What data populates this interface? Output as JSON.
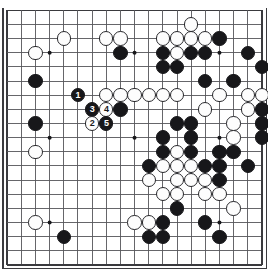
{
  "diagram": {
    "board_size": 19,
    "geometry": {
      "origin_x": 7.2,
      "origin_y": 10.3,
      "step": 14.15,
      "stone_radius": 7.2,
      "hoshi_radius": 2.0
    },
    "colors": {
      "background": "#ffffff",
      "line": "#55555a",
      "border": "#3a3a3e",
      "black_stone": "#17171a",
      "white_stone": "#fdfdfd",
      "white_stone_edge": "#28282c",
      "black_label": "#ffffff",
      "white_label": "#1a1a1d"
    },
    "hoshi": [
      {
        "col": 3,
        "row": 3
      },
      {
        "col": 9,
        "row": 3
      },
      {
        "col": 15,
        "row": 3
      },
      {
        "col": 3,
        "row": 9
      },
      {
        "col": 9,
        "row": 9
      },
      {
        "col": 15,
        "row": 9
      },
      {
        "col": 3,
        "row": 15
      },
      {
        "col": 9,
        "row": 15
      },
      {
        "col": 15,
        "row": 15
      }
    ],
    "stones": [
      {
        "col": 13,
        "row": 1,
        "color": "white"
      },
      {
        "col": 4,
        "row": 2,
        "color": "white"
      },
      {
        "col": 7,
        "row": 2,
        "color": "white"
      },
      {
        "col": 8,
        "row": 2,
        "color": "white"
      },
      {
        "col": 11,
        "row": 2,
        "color": "white"
      },
      {
        "col": 12,
        "row": 2,
        "color": "white"
      },
      {
        "col": 13,
        "row": 2,
        "color": "white"
      },
      {
        "col": 14,
        "row": 2,
        "color": "white"
      },
      {
        "col": 15,
        "row": 2,
        "color": "black"
      },
      {
        "col": 2,
        "row": 3,
        "color": "white"
      },
      {
        "col": 8,
        "row": 3,
        "color": "black"
      },
      {
        "col": 11,
        "row": 3,
        "color": "black"
      },
      {
        "col": 12,
        "row": 3,
        "color": "white"
      },
      {
        "col": 13,
        "row": 3,
        "color": "black"
      },
      {
        "col": 14,
        "row": 3,
        "color": "black"
      },
      {
        "col": 17,
        "row": 3,
        "color": "black"
      },
      {
        "col": 11,
        "row": 4,
        "color": "black"
      },
      {
        "col": 12,
        "row": 4,
        "color": "black"
      },
      {
        "col": 18,
        "row": 4,
        "color": "black"
      },
      {
        "col": 2,
        "row": 5,
        "color": "black"
      },
      {
        "col": 14,
        "row": 5,
        "color": "black"
      },
      {
        "col": 16,
        "row": 5,
        "color": "black"
      },
      {
        "col": 5,
        "row": 6,
        "color": "black",
        "label": "1"
      },
      {
        "col": 7,
        "row": 6,
        "color": "white"
      },
      {
        "col": 8,
        "row": 6,
        "color": "white"
      },
      {
        "col": 9,
        "row": 6,
        "color": "white"
      },
      {
        "col": 10,
        "row": 6,
        "color": "white"
      },
      {
        "col": 11,
        "row": 6,
        "color": "white"
      },
      {
        "col": 12,
        "row": 6,
        "color": "white"
      },
      {
        "col": 15,
        "row": 6,
        "color": "white"
      },
      {
        "col": 17,
        "row": 6,
        "color": "white"
      },
      {
        "col": 18,
        "row": 6,
        "color": "white"
      },
      {
        "col": 6,
        "row": 7,
        "color": "black",
        "label": "3"
      },
      {
        "col": 7,
        "row": 7,
        "color": "white",
        "label": "4"
      },
      {
        "col": 8,
        "row": 7,
        "color": "black"
      },
      {
        "col": 14,
        "row": 7,
        "color": "white"
      },
      {
        "col": 17,
        "row": 7,
        "color": "white"
      },
      {
        "col": 18,
        "row": 7,
        "color": "black"
      },
      {
        "col": 2,
        "row": 8,
        "color": "black"
      },
      {
        "col": 6,
        "row": 8,
        "color": "white",
        "label": "2"
      },
      {
        "col": 7,
        "row": 8,
        "color": "black",
        "label": "5"
      },
      {
        "col": 12,
        "row": 8,
        "color": "black"
      },
      {
        "col": 13,
        "row": 8,
        "color": "black"
      },
      {
        "col": 16,
        "row": 8,
        "color": "white"
      },
      {
        "col": 18,
        "row": 8,
        "color": "black"
      },
      {
        "col": 11,
        "row": 9,
        "color": "black"
      },
      {
        "col": 13,
        "row": 9,
        "color": "black"
      },
      {
        "col": 16,
        "row": 9,
        "color": "white"
      },
      {
        "col": 18,
        "row": 9,
        "color": "black"
      },
      {
        "col": 2,
        "row": 10,
        "color": "white"
      },
      {
        "col": 11,
        "row": 10,
        "color": "black"
      },
      {
        "col": 12,
        "row": 10,
        "color": "white"
      },
      {
        "col": 13,
        "row": 10,
        "color": "black"
      },
      {
        "col": 15,
        "row": 10,
        "color": "black"
      },
      {
        "col": 16,
        "row": 10,
        "color": "black"
      },
      {
        "col": 10,
        "row": 11,
        "color": "black"
      },
      {
        "col": 11,
        "row": 11,
        "color": "white"
      },
      {
        "col": 12,
        "row": 11,
        "color": "white"
      },
      {
        "col": 13,
        "row": 11,
        "color": "white"
      },
      {
        "col": 14,
        "row": 11,
        "color": "black"
      },
      {
        "col": 15,
        "row": 11,
        "color": "black"
      },
      {
        "col": 17,
        "row": 11,
        "color": "black"
      },
      {
        "col": 10,
        "row": 12,
        "color": "white"
      },
      {
        "col": 12,
        "row": 12,
        "color": "white"
      },
      {
        "col": 13,
        "row": 12,
        "color": "white"
      },
      {
        "col": 14,
        "row": 12,
        "color": "white"
      },
      {
        "col": 15,
        "row": 12,
        "color": "black"
      },
      {
        "col": 11,
        "row": 13,
        "color": "white"
      },
      {
        "col": 12,
        "row": 13,
        "color": "white"
      },
      {
        "col": 14,
        "row": 13,
        "color": "white"
      },
      {
        "col": 15,
        "row": 13,
        "color": "white"
      },
      {
        "col": 12,
        "row": 14,
        "color": "black"
      },
      {
        "col": 16,
        "row": 14,
        "color": "white"
      },
      {
        "col": 2,
        "row": 15,
        "color": "white"
      },
      {
        "col": 9,
        "row": 15,
        "color": "white"
      },
      {
        "col": 10,
        "row": 15,
        "color": "white"
      },
      {
        "col": 11,
        "row": 15,
        "color": "black"
      },
      {
        "col": 14,
        "row": 15,
        "color": "black"
      },
      {
        "col": 4,
        "row": 16,
        "color": "black"
      },
      {
        "col": 10,
        "row": 16,
        "color": "black"
      },
      {
        "col": 11,
        "row": 16,
        "color": "black"
      },
      {
        "col": 15,
        "row": 16,
        "color": "black"
      }
    ],
    "move_sequence": [
      {
        "label": "1",
        "color": "black"
      },
      {
        "label": "2",
        "color": "white"
      },
      {
        "label": "3",
        "color": "black"
      },
      {
        "label": "4",
        "color": "white"
      },
      {
        "label": "5",
        "color": "black"
      }
    ]
  }
}
